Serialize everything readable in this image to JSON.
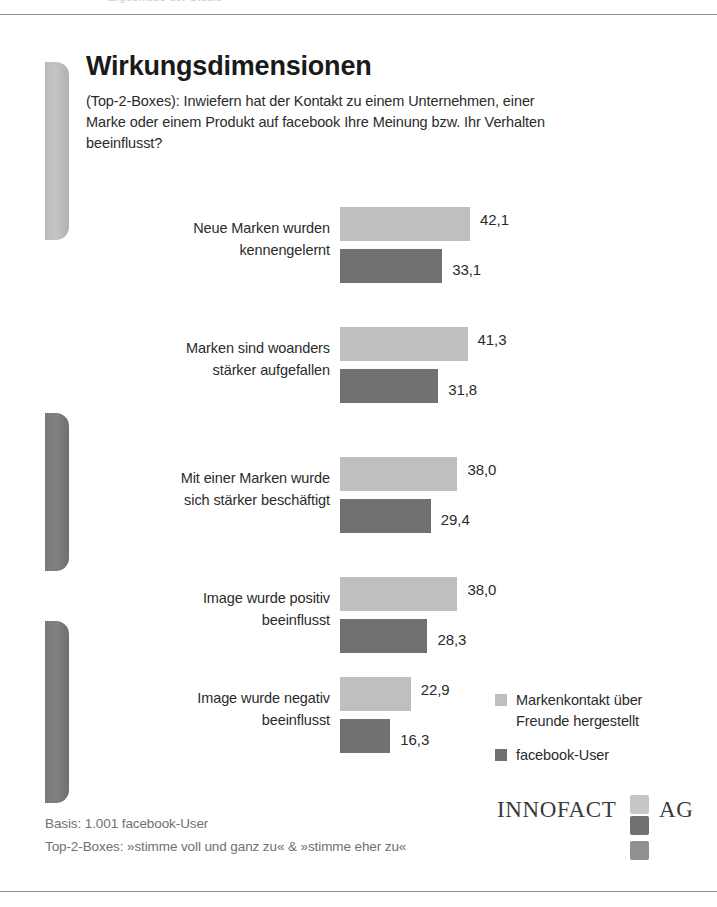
{
  "page": {
    "cutoff_top_text": "Ergebnisse der Studie",
    "background": "#ffffff"
  },
  "header": {
    "title": "Wirkungsdimensionen",
    "subtitle": "(Top-2-Boxes): Inwiefern hat der Kontakt zu einem Unternehmen, einer Marke oder einem Produkt auf facebook Ihre Meinung bzw. Ihr Verhalten beeinflusst?"
  },
  "colors": {
    "series_light": "#bdbfc1",
    "series_dark": "#6f7173",
    "text": "#2b2b2b",
    "muted_text": "#6f7173",
    "rule": "#8e9094"
  },
  "chart_data": {
    "type": "bar",
    "orientation": "horizontal",
    "title": "Wirkungsdimensionen",
    "subtitle": "(Top-2-Boxes): Inwiefern hat der Kontakt zu einem Unternehmen, einer Marke oder einem Produkt auf facebook Ihre Meinung bzw. Ihr Verhalten beeinflusst?",
    "xlabel": "",
    "ylabel": "",
    "xlim": [
      0,
      45
    ],
    "grid": false,
    "legend_position": "right-bottom",
    "categories": [
      "Neue Marken wurden kennengelernt",
      "Marken sind woanders stärker aufgefallen",
      "Mit einer Marken wurde sich stärker beschäftigt",
      "Image wurde positiv beeinflusst",
      "Image wurde negativ beeinflusst"
    ],
    "category_lines": [
      [
        "Neue Marken wurden",
        "kennengelernt"
      ],
      [
        "Marken sind woanders",
        "stärker aufgefallen"
      ],
      [
        "Mit einer Marken wurde",
        "sich stärker beschäftigt"
      ],
      [
        "Image wurde positiv",
        "beeinflusst"
      ],
      [
        "Image wurde negativ",
        "beeinflusst"
      ]
    ],
    "series": [
      {
        "name": "Markenkontakt über Freunde hergestellt",
        "color": "#bdbfc1",
        "values": [
          42.1,
          41.3,
          38.0,
          38.0,
          22.9
        ],
        "labels": [
          "42,1",
          "41,3",
          "38,0",
          "38,0",
          "22,9"
        ]
      },
      {
        "name": "facebook-User",
        "color": "#6f7173",
        "values": [
          33.1,
          31.8,
          29.4,
          28.3,
          16.3
        ],
        "labels": [
          "33,1",
          "31,8",
          "29,4",
          "28,3",
          "16,3"
        ]
      }
    ]
  },
  "legend": {
    "items": [
      {
        "label_line1": "Markenkontakt über",
        "label_line2": "Freunde hergestellt",
        "swatch": "light"
      },
      {
        "label_line1": "facebook-User",
        "label_line2": "",
        "swatch": "dark"
      }
    ]
  },
  "footer": {
    "basis": "Basis: 1.001 facebook-User",
    "note": "Top-2-Boxes: »stimme voll und ganz zu« & »stimme eher zu«"
  },
  "logo": {
    "word1": "INNOFACT",
    "word2": "AG"
  }
}
